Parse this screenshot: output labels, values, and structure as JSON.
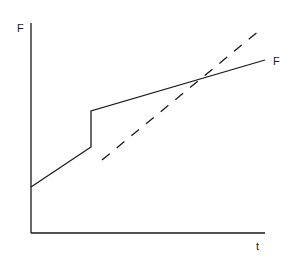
{
  "diagram": {
    "axes": {
      "y_label": "F",
      "x_label": "t",
      "color": "#1a1a1a"
    },
    "curves": [
      {
        "name": "F",
        "style": "solid",
        "label": "F",
        "points": [
          [
            31,
            187
          ],
          [
            91,
            147
          ],
          [
            91,
            111
          ],
          [
            265,
            60
          ]
        ]
      },
      {
        "name": "extrapolated",
        "style": "dashed",
        "points": [
          [
            102,
            160
          ],
          [
            260,
            30
          ]
        ]
      }
    ]
  }
}
